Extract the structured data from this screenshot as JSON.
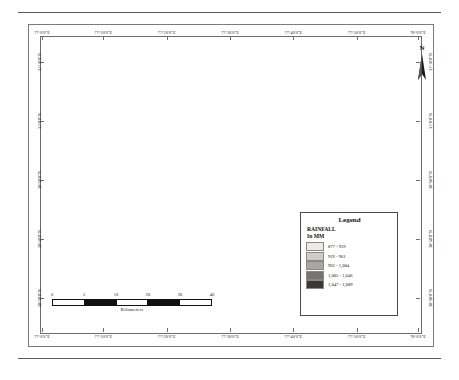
{
  "figure": {
    "title_visible": "",
    "north_arrow_label": "N"
  },
  "map": {
    "top_axis_labels": [
      "77°0'0\"E",
      "77°10'0\"E",
      "77°20'0\"E",
      "77°30'0\"E",
      "77°40'0\"E",
      "77°50'0\"E",
      "78°0'0\"E"
    ],
    "bottom_axis_labels": [
      "77°0'0\"E",
      "77°10'0\"E",
      "77°20'0\"E",
      "77°30'0\"E",
      "77°40'0\"E",
      "77°50'0\"E",
      "78°0'0\"E"
    ],
    "left_axis_labels": [
      "31°10'0\"N",
      "31°0'0\"N",
      "30°50'0\"N",
      "30°40'0\"N",
      "30°30'0\"N"
    ],
    "right_axis_labels": [
      "31°10'0\"N",
      "31°0'0\"N",
      "30°50'0\"N",
      "30°40'0\"N",
      "30°30'0\"N"
    ]
  },
  "legend": {
    "title": "Legend",
    "subtitle_line1": "RAINFALL",
    "subtitle_line2": "In MM",
    "classes": [
      {
        "label": "877 - 919",
        "color": "#eceae2"
      },
      {
        "label": "919 - 961",
        "color": "#cfcdc4"
      },
      {
        "label": "962 - 1,004",
        "color": "#a9a7a0"
      },
      {
        "label": "1,005 - 1,046",
        "color": "#777570"
      },
      {
        "label": "1,047 - 1,089",
        "color": "#3a3936"
      }
    ]
  },
  "scalebar": {
    "ticks": [
      "0",
      "5",
      "10",
      "20",
      "30",
      "40"
    ],
    "units": "Kilometers"
  },
  "chart_data": {
    "type": "heatmap",
    "legend_position": "bottom-right inside map frame",
    "classes": [
      "877 - 919",
      "919 - 961",
      "962 - 1,004",
      "1,005 - 1,046",
      "1,047 - 1,089"
    ],
    "class_colors": [
      "#eceae2",
      "#cfcdc4",
      "#a9a7a0",
      "#777570",
      "#3a3936"
    ],
    "x_axis": {
      "label": "Longitude",
      "ticks": [
        "77°0'0\"E",
        "77°10'0\"E",
        "77°20'0\"E",
        "77°30'0\"E",
        "77°40'0\"E",
        "77°50'0\"E",
        "78°0'0\"E"
      ]
    },
    "y_axis": {
      "label": "Latitude",
      "ticks": [
        "31°10'0\"N",
        "31°0'0\"N",
        "30°50'0\"N",
        "30°40'0\"N",
        "30°30'0\"N"
      ]
    },
    "scale_bar_km": [
      0,
      5,
      10,
      20,
      30,
      40
    ]
  }
}
